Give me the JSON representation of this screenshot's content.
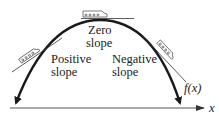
{
  "diagram": {
    "title": "",
    "labels": {
      "zero_slope_line1": "Zero",
      "zero_slope_line2": "slope",
      "positive_slope_line1": "Positive",
      "positive_slope_line2": "slope",
      "negative_slope_line1": "Negative",
      "negative_slope_line2": "slope",
      "function_label": "f(x)",
      "x_axis_label": "x"
    },
    "colors": {
      "curve": "#1a1a1a",
      "axis": "#555555",
      "tangent": "#333333",
      "text": "#222222"
    }
  }
}
